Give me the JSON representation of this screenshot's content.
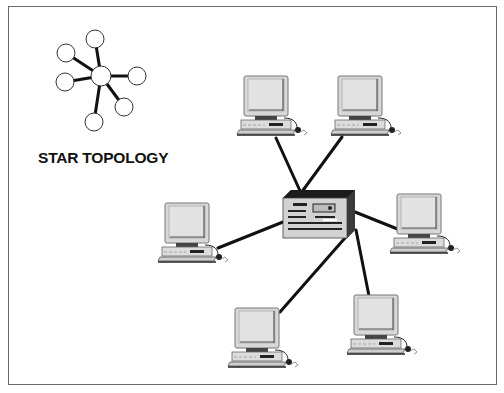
{
  "figure": {
    "title": "STAR TOPOLOGY",
    "caption": "",
    "colors": {
      "frame": "#6a6a6a",
      "cable": "#111111",
      "monitor_face": "#d9d9d9",
      "server_body": "#cfcfcf",
      "server_side": "#3a3a3a"
    }
  },
  "legend_icon": {
    "hub": {
      "x": 101,
      "y": 76,
      "r": 10
    },
    "nodes": [
      {
        "x": 95,
        "y": 39
      },
      {
        "x": 66,
        "y": 53
      },
      {
        "x": 137,
        "y": 76
      },
      {
        "x": 65,
        "y": 82
      },
      {
        "x": 124,
        "y": 107
      },
      {
        "x": 94,
        "y": 122
      }
    ]
  },
  "network": {
    "hub": {
      "label": "server",
      "x": 283,
      "y": 188
    },
    "workstations": [
      {
        "id": "pc-top-left",
        "x": 237,
        "y": 73,
        "link": [
          273,
          138,
          301,
          193
        ]
      },
      {
        "id": "pc-top-right",
        "x": 331,
        "y": 73,
        "link": [
          341,
          138,
          301,
          193
        ]
      },
      {
        "id": "pc-mid-left",
        "x": 158,
        "y": 202,
        "link": [
          218,
          248,
          286,
          220
        ]
      },
      {
        "id": "pc-mid-right",
        "x": 390,
        "y": 193,
        "link": [
          402,
          231,
          357,
          213
        ]
      },
      {
        "id": "pc-bottom-left",
        "x": 225,
        "y": 306,
        "link": [
          280,
          310,
          353,
          229
        ]
      },
      {
        "id": "pc-bottom-right",
        "x": 347,
        "y": 293,
        "link": [
          368,
          295,
          355,
          231
        ]
      }
    ]
  }
}
